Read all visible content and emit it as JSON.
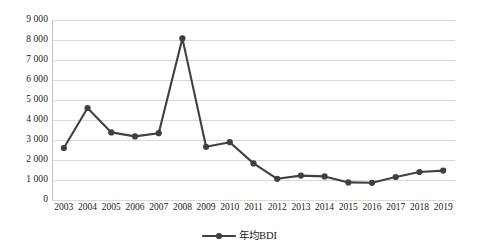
{
  "chart_data": {
    "type": "line",
    "title": "",
    "subtitle": "",
    "xlabel": "",
    "ylabel": "",
    "categories": [
      "2003",
      "2004",
      "2005",
      "2006",
      "2007",
      "2008",
      "2009",
      "2010",
      "2011",
      "2012",
      "2013",
      "2014",
      "2015",
      "2016",
      "2017",
      "2018",
      "2019"
    ],
    "series": [
      {
        "name": "年均BDI",
        "values": [
          2600,
          4600,
          3380,
          3180,
          3340,
          8080,
          2660,
          2890,
          1830,
          1060,
          1220,
          1180,
          880,
          860,
          1150,
          1400,
          1470
        ]
      }
    ],
    "ylim": [
      0,
      9000
    ],
    "ytick_labels": [
      "9 000",
      "8 000",
      "7 000",
      "6 000",
      "5 000",
      "4 000",
      "3 000",
      "2 000",
      "1 000",
      "0"
    ],
    "ytick_values": [
      9000,
      8000,
      7000,
      6000,
      5000,
      4000,
      3000,
      2000,
      1000,
      0
    ],
    "grid": true,
    "legend_position": "bottom",
    "colors": {
      "series_line": "#404040",
      "gridline": "#d9d9d9",
      "axis": "#bfbfbf",
      "text": "#1a1a1a"
    },
    "marker": "circle"
  },
  "legend": {
    "entries": [
      {
        "label": "年均BDI",
        "symbol": "line-marker-icon"
      }
    ]
  }
}
